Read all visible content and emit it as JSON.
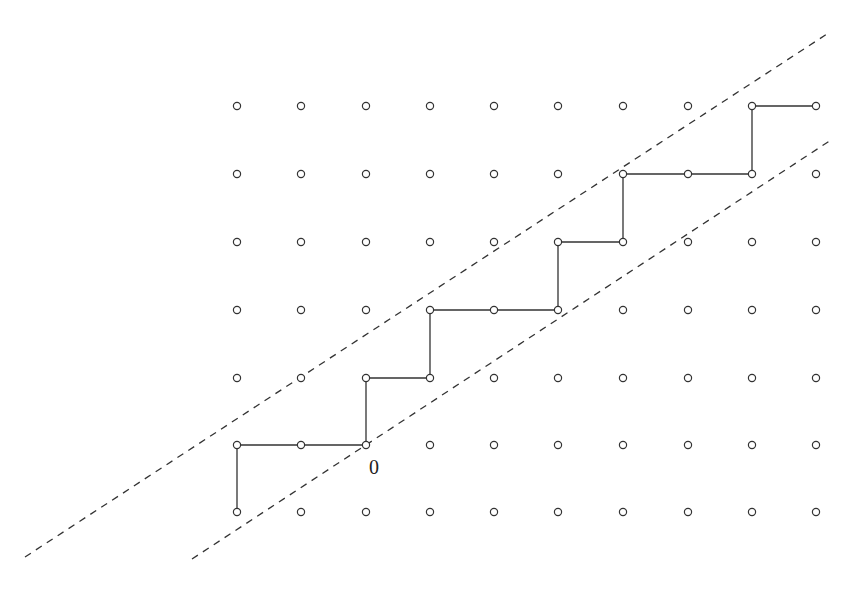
{
  "diagram": {
    "type": "lattice-path",
    "grid": {
      "columns_x": [
        237,
        301,
        366,
        430,
        494,
        558,
        623,
        688,
        752,
        816
      ],
      "rows_y": [
        106,
        174,
        242,
        310,
        378,
        445,
        512
      ],
      "point_radius": 3.6,
      "point_stroke": "#333333"
    },
    "path": {
      "color": "#333333",
      "points": [
        [
          0,
          6
        ],
        [
          0,
          5
        ],
        [
          2,
          5
        ],
        [
          2,
          4
        ],
        [
          3,
          4
        ],
        [
          3,
          3
        ],
        [
          5,
          3
        ],
        [
          5,
          2
        ],
        [
          6,
          2
        ],
        [
          6,
          1
        ],
        [
          8,
          1
        ],
        [
          8,
          0
        ],
        [
          9,
          0
        ]
      ]
    },
    "dashed_lines": [
      {
        "name": "upper-boundary-line",
        "x1": 25,
        "y1": 557,
        "x2": 830,
        "y2": 32
      },
      {
        "name": "lower-boundary-line",
        "x1": 192,
        "y1": 559,
        "x2": 831,
        "y2": 140
      }
    ],
    "origin_label": {
      "text": "0",
      "x": 369,
      "y": 456
    }
  }
}
